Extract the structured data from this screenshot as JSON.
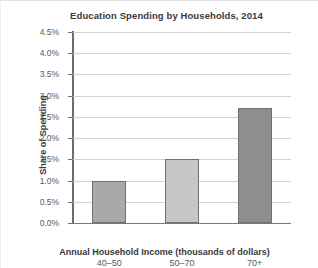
{
  "chart_data": {
    "type": "bar",
    "title": "Education Spending by Households, 2014",
    "xlabel": "Annual Household Income (thousands of dollars)",
    "ylabel": "Share of Spending",
    "categories": [
      "40–50",
      "50–70",
      "70+"
    ],
    "values": [
      1.0,
      1.5,
      2.7
    ],
    "value_labels": [
      "1.0%",
      "1.5%",
      "2.7%"
    ],
    "ylim": [
      0.0,
      4.5
    ],
    "ytick_labels": [
      "4.5%",
      "4.0%",
      "3.5%",
      "3.0%",
      "2.5%",
      "2.0%",
      "1.5%",
      "1.0%",
      "0.5%",
      "0.0%"
    ],
    "ytick_values": [
      4.5,
      4.0,
      3.5,
      3.0,
      2.5,
      2.0,
      1.5,
      1.0,
      0.5,
      0.0
    ],
    "grid": "horizontal",
    "legend": "none",
    "bar_colors": [
      "#a9a9a9",
      "#c6c6c6",
      "#8f8f8f"
    ],
    "bar_border_color": "#6f6f6f",
    "gridline_color": "#d2d2d2",
    "axis_color": "#6e6e6e",
    "text_color": "#3a3a3a",
    "tick_text_color": "#595959",
    "background_color": "#ffffff"
  }
}
